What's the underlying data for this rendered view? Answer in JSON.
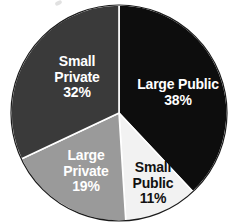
{
  "chart_data": {
    "type": "pie",
    "title": "",
    "subtitle": "",
    "xlabel": "",
    "ylabel": "",
    "grid": false,
    "legend_position": "none",
    "labels_inside_slices": true,
    "start_angle_deg": 0,
    "direction": "clockwise",
    "categories": [
      "Large Public",
      "Small Public",
      "Large Private",
      "Small Private"
    ],
    "values": [
      38,
      11,
      19,
      32
    ],
    "value_unit": "%",
    "slices": [
      {
        "label": "Large Public",
        "label_line1": "Large Public",
        "label_line2": "",
        "value": 38,
        "value_text": "38%",
        "color": "#0d0d0d",
        "text_color": "#ffffff",
        "start_angle_deg": 0,
        "end_angle_deg": 136.8
      },
      {
        "label": "Small Public",
        "label_line1": "Small",
        "label_line2": "Public",
        "value": 11,
        "value_text": "11%",
        "color": "#f2f2f2",
        "text_color": "#111111",
        "start_angle_deg": 136.8,
        "end_angle_deg": 176.4
      },
      {
        "label": "Large Private",
        "label_line1": "Large",
        "label_line2": "Private",
        "value": 19,
        "value_text": "19%",
        "color": "#9a9a9a",
        "text_color": "#ffffff",
        "start_angle_deg": 176.4,
        "end_angle_deg": 244.8
      },
      {
        "label": "Small Private",
        "label_line1": "Small",
        "label_line2": "Private",
        "value": 32,
        "value_text": "32%",
        "color": "#3a3a3a",
        "text_color": "#ffffff",
        "start_angle_deg": 244.8,
        "end_angle_deg": 360
      }
    ],
    "geometry": {
      "center_x": 119,
      "center_y": 113,
      "radius": 108
    },
    "colors": {
      "background": "#ffffff",
      "outline": "#1a1a1a",
      "large_public": "#0d0d0d",
      "small_public": "#f2f2f2",
      "large_private": "#9a9a9a",
      "small_private": "#3a3a3a"
    }
  }
}
